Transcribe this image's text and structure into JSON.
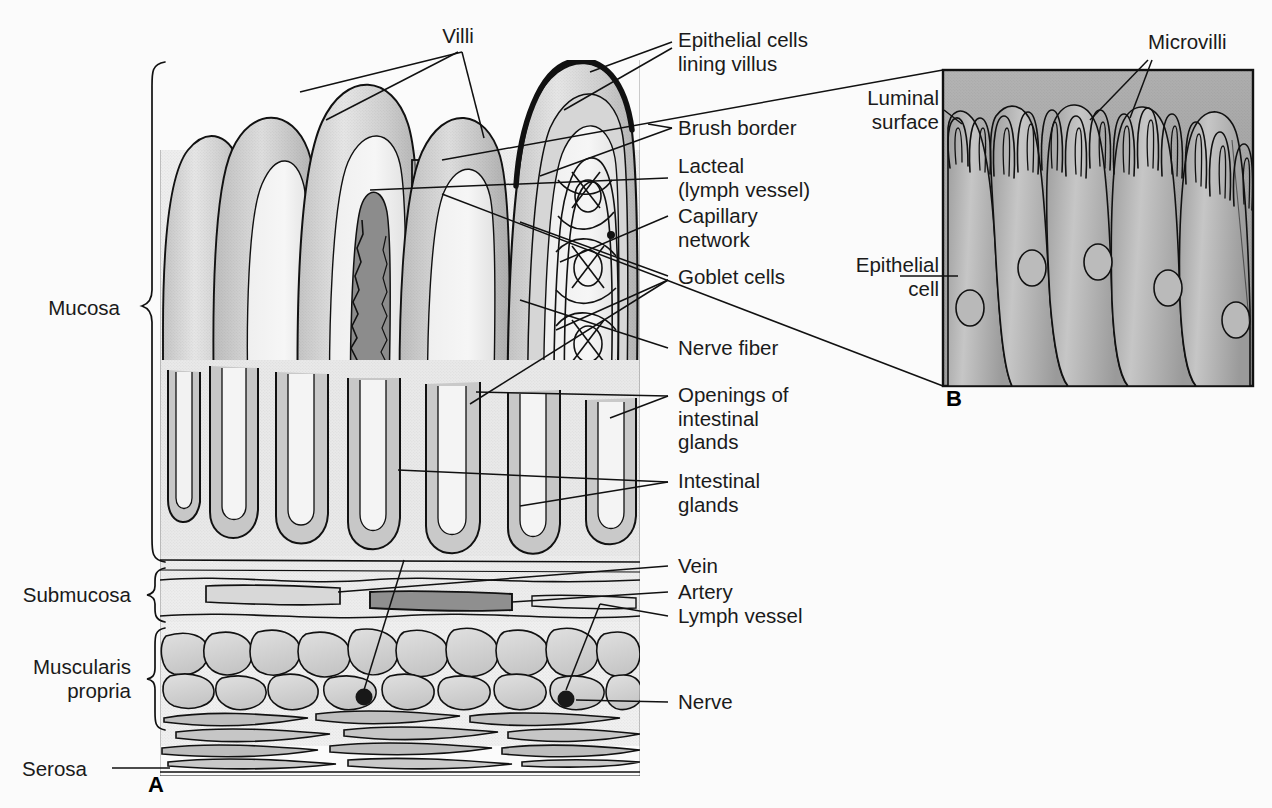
{
  "figure": {
    "background_color": "#fbfbfb",
    "ink_color": "#111111",
    "panels": [
      {
        "id": "A",
        "label": "A",
        "caption": "Cross-section of intestinal wall showing villi and layers"
      },
      {
        "id": "B",
        "label": "B",
        "caption": "Magnified epithelial cells with microvilli"
      }
    ]
  },
  "layer_labels": [
    {
      "id": "mucosa",
      "text": "Mucosa"
    },
    {
      "id": "submucosa",
      "text": "Submucosa"
    },
    {
      "id": "muscularis-propria",
      "text": "Muscularis\npropria"
    },
    {
      "id": "serosa",
      "text": "Serosa"
    }
  ],
  "panel_a_labels": [
    {
      "id": "villi",
      "text": "Villi"
    },
    {
      "id": "epithelial-cells-lining-villus",
      "text": "Epithelial cells\nlining villus"
    },
    {
      "id": "brush-border",
      "text": "Brush border"
    },
    {
      "id": "lacteal",
      "text": "Lacteal\n(lymph vessel)"
    },
    {
      "id": "capillary-network",
      "text": "Capillary\nnetwork"
    },
    {
      "id": "goblet-cells",
      "text": "Goblet cells"
    },
    {
      "id": "nerve-fiber",
      "text": "Nerve fiber"
    },
    {
      "id": "openings-of-intestinal-glands",
      "text": "Openings of\nintestinal\nglands"
    },
    {
      "id": "intestinal-glands",
      "text": "Intestinal\nglands"
    },
    {
      "id": "vein",
      "text": "Vein"
    },
    {
      "id": "artery",
      "text": "Artery"
    },
    {
      "id": "lymph-vessel",
      "text": "Lymph vessel"
    },
    {
      "id": "nerve",
      "text": "Nerve"
    }
  ],
  "panel_b_labels": [
    {
      "id": "microvilli",
      "text": "Microvilli"
    },
    {
      "id": "luminal-surface",
      "text": "Luminal\nsurface"
    },
    {
      "id": "epithelial-cell",
      "text": "Epithelial\ncell"
    }
  ],
  "colors": {
    "background": "#fbfbfb",
    "ink": "#111111",
    "tissue_light": "#dcdcdc",
    "tissue_mid": "#c2c2c2",
    "tissue_dark": "#a0a0a0",
    "vessel_dark": "#7d7d7d",
    "inset_fill": "#ababab",
    "nerve_dot": "#1a1a1a"
  }
}
